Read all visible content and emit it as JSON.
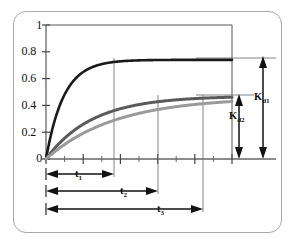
{
  "figure": {
    "frame_color": "#a8a8a8",
    "background": "#ffffff"
  },
  "axis": {
    "y_ticks": [
      "0",
      "0.2",
      "0.4",
      "0.6",
      "0.8",
      "1"
    ],
    "y_tick_values": [
      0,
      0.2,
      0.4,
      0.6,
      0.8,
      1
    ],
    "x_label": "",
    "y_label": ""
  },
  "annotations": {
    "kd1": "K",
    "kd1_sub": "d1",
    "kd2": "K",
    "kd2_sub": "d2",
    "t1": "t",
    "t1_sub": "1",
    "t2": "t",
    "t2_sub": "2",
    "t3": "t",
    "t3_sub": "3"
  },
  "chart_data": {
    "type": "line",
    "title": "",
    "xlabel": "",
    "ylabel": "",
    "xlim": [
      0,
      10
    ],
    "ylim": [
      0,
      1
    ],
    "grid": false,
    "legend": false,
    "x_tick_labels": [],
    "y_tick_labels": [
      "0",
      "0.2",
      "0.4",
      "0.6",
      "0.8",
      "1"
    ],
    "y_tick_values": [
      0,
      0.2,
      0.4,
      0.6,
      0.8,
      1
    ],
    "x_major_ticks": [
      0,
      2,
      4,
      6,
      8,
      10
    ],
    "x_minor_ticks": [
      1,
      3,
      5,
      7,
      9
    ],
    "series": [
      {
        "name": "curve-1",
        "color": "#1a1a1a",
        "plateau": 0.74,
        "rate": 1.05,
        "x": [
          0,
          0.25,
          0.5,
          0.75,
          1.0,
          1.5,
          2.0,
          2.5,
          3.0,
          3.5,
          4.0,
          5.0,
          6.0,
          7.0,
          8.0,
          9.0,
          10.0
        ],
        "values": [
          0.0,
          0.17,
          0.31,
          0.41,
          0.48,
          0.59,
          0.65,
          0.69,
          0.71,
          0.72,
          0.73,
          0.74,
          0.74,
          0.74,
          0.74,
          0.74,
          0.74
        ]
      },
      {
        "name": "curve-2",
        "color": "#5a5a5a",
        "plateau": 0.47,
        "rate": 0.4,
        "x": [
          0,
          0.25,
          0.5,
          0.75,
          1.0,
          1.5,
          2.0,
          2.5,
          3.0,
          3.5,
          4.0,
          5.0,
          6.0,
          7.0,
          8.0,
          9.0,
          10.0
        ],
        "values": [
          0.0,
          0.045,
          0.086,
          0.124,
          0.158,
          0.219,
          0.268,
          0.308,
          0.339,
          0.365,
          0.386,
          0.416,
          0.435,
          0.447,
          0.455,
          0.461,
          0.465
        ]
      },
      {
        "name": "curve-3",
        "color": "#9a9a9a",
        "plateau": 0.46,
        "rate": 0.27,
        "x": [
          0,
          0.25,
          0.5,
          0.75,
          1.0,
          1.5,
          2.0,
          2.5,
          3.0,
          3.5,
          4.0,
          5.0,
          6.0,
          7.0,
          8.0,
          9.0,
          10.0
        ],
        "values": [
          0.0,
          0.03,
          0.058,
          0.085,
          0.11,
          0.156,
          0.197,
          0.232,
          0.263,
          0.29,
          0.314,
          0.352,
          0.381,
          0.402,
          0.418,
          0.43,
          0.439
        ]
      }
    ],
    "markers": {
      "t1": {
        "label": "t1",
        "x_end": 2.95,
        "drop_to": 0.74
      },
      "t2": {
        "label": "t2",
        "x_end": 5.25,
        "drop_to": 0.465
      },
      "t3": {
        "label": "t3",
        "x_end": 7.75,
        "drop_to": 0.465
      }
    },
    "brackets": {
      "kd1": {
        "label": "Kd1",
        "from": 0.0,
        "to": 0.74
      },
      "kd2": {
        "label": "Kd2",
        "from": 0.0,
        "to": 0.465
      }
    }
  }
}
